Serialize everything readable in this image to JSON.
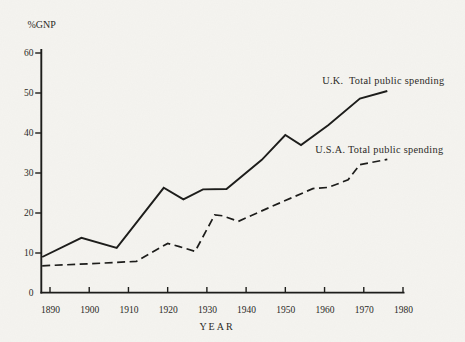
{
  "figure": {
    "background_color": "#f5f4f0",
    "ink_color": "#1d1d1b",
    "text_color": "#2b2a26"
  },
  "chart_data": {
    "type": "line",
    "title": "",
    "ylabel": "%GNP",
    "xlabel": "YEAR",
    "xlim": [
      1890,
      1980
    ],
    "ylim": [
      0,
      60
    ],
    "x_ticks": [
      1890,
      1900,
      1910,
      1920,
      1930,
      1940,
      1950,
      1960,
      1970,
      1980
    ],
    "y_ticks": [
      0,
      10,
      20,
      30,
      40,
      50,
      60
    ],
    "grid": false,
    "legend_position": "inline-annotations",
    "series": [
      {
        "name": "U.K. Total public spending",
        "style": "solid",
        "points": [
          [
            1888,
            9.0
          ],
          [
            1898,
            13.8
          ],
          [
            1907,
            11.3
          ],
          [
            1919,
            26.3
          ],
          [
            1924,
            23.4
          ],
          [
            1929,
            25.9
          ],
          [
            1935,
            26.0
          ],
          [
            1944,
            33.3
          ],
          [
            1950,
            39.5
          ],
          [
            1954,
            37.0
          ],
          [
            1961,
            42.0
          ],
          [
            1969,
            48.6
          ],
          [
            1976,
            50.5
          ]
        ]
      },
      {
        "name": "U.S.A. Total public spending",
        "style": "dashed",
        "points": [
          [
            1888,
            6.8
          ],
          [
            1900,
            7.3
          ],
          [
            1912,
            7.9
          ],
          [
            1920,
            12.4
          ],
          [
            1923,
            11.6
          ],
          [
            1927,
            10.4
          ],
          [
            1932,
            19.5
          ],
          [
            1934,
            19.3
          ],
          [
            1938,
            17.9
          ],
          [
            1946,
            21.4
          ],
          [
            1957,
            26.1
          ],
          [
            1961,
            26.4
          ],
          [
            1966,
            28.3
          ],
          [
            1969,
            32.1
          ],
          [
            1976,
            33.4
          ]
        ]
      }
    ],
    "annotations": [
      {
        "id": "uk-label",
        "text": "U.K.  Total public spending",
        "x_year": 1959.4,
        "y_value": 52.3
      },
      {
        "id": "usa-label",
        "text": "U.S.A. Total public spending",
        "x_year": 1957.6,
        "y_value": 35.0
      }
    ]
  }
}
